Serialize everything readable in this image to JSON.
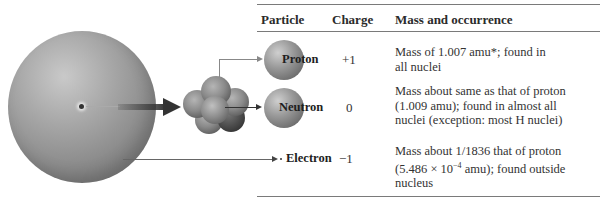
{
  "table": {
    "headers": {
      "particle": "Particle",
      "charge": "Charge",
      "mass": "Mass and occurrence"
    },
    "rows": [
      {
        "particle": "Proton",
        "charge": "+1",
        "mass_lines": [
          "Mass of 1.007 amu*; found in",
          "all nuclei"
        ]
      },
      {
        "particle": "Neutron",
        "charge": "0",
        "mass_lines": [
          "Mass about same as that of proton",
          "(1.009 amu); found in almost all",
          "nuclei (exception: most H nuclei)"
        ]
      },
      {
        "particle": "Electron",
        "charge": "−1",
        "mass_lines": [
          "Mass about 1/1836 that of proton",
          "(5.486 × 10",
          "−4",
          " amu); found outside",
          "nucleus"
        ]
      }
    ]
  },
  "diagram": {
    "atom_label": "atom",
    "nucleus_label": "nucleus",
    "colors": {
      "sphere": "#8a8a8a",
      "arrow": "#333333",
      "rule": "#7a7a7a"
    }
  }
}
